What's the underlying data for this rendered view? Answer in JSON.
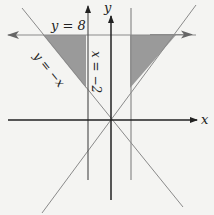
{
  "diagram": {
    "title": "",
    "axes": {
      "x_label": "x",
      "y_label": "y"
    },
    "lines": [
      {
        "id": "horizontal",
        "equation_label": "y = 8"
      },
      {
        "id": "vertical-left",
        "equation_label": "x = −2"
      },
      {
        "id": "diagonal-neg",
        "equation_label": "y = −x"
      },
      {
        "id": "vertical-right",
        "equation_label": ""
      },
      {
        "id": "diagonal-pos",
        "equation_label": ""
      }
    ],
    "shaded_regions": [
      {
        "id": "left-triangle",
        "description": "bounded by y = 8, x = -2, y = -x"
      },
      {
        "id": "right-triangle",
        "description": "bounded by y = 8, x = 2, y = x"
      }
    ],
    "colors": {
      "background": "#f4f4f2",
      "axis": "#222222",
      "line": "#8a8a8a",
      "shade": "#9a9a9a"
    }
  }
}
